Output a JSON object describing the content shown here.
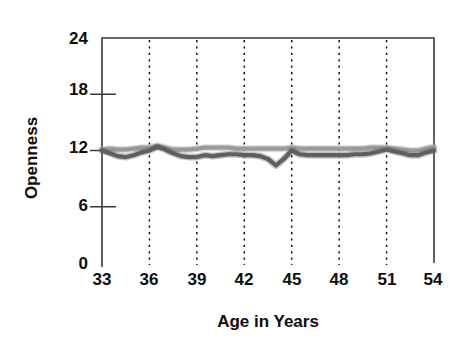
{
  "chart_data": {
    "type": "line",
    "title": "",
    "xlabel": "Age in Years",
    "ylabel": "Openness",
    "xlim": [
      33,
      54
    ],
    "ylim": [
      0,
      24
    ],
    "xticks": [
      33,
      36,
      39,
      42,
      45,
      48,
      51,
      54
    ],
    "yticks": [
      0,
      6,
      12,
      18,
      24
    ],
    "grid": "vertical-dotted-at-xticks",
    "legend": "none",
    "colors": {
      "series_light": "#9a9a9a",
      "series_dark": "#5f5f5f",
      "axis": "#3a3a3a",
      "text": "#0d0d0d"
    },
    "x": [
      33.0,
      33.5,
      34.0,
      34.5,
      35.0,
      35.5,
      36.0,
      36.5,
      37.0,
      37.5,
      38.0,
      38.5,
      39.0,
      39.5,
      40.0,
      40.5,
      41.0,
      41.5,
      42.0,
      42.5,
      43.0,
      43.5,
      44.0,
      44.5,
      45.0,
      45.5,
      46.0,
      46.5,
      47.0,
      47.5,
      48.0,
      48.5,
      49.0,
      49.5,
      50.0,
      50.5,
      51.0,
      51.5,
      52.0,
      52.5,
      53.0,
      53.5,
      54.0
    ],
    "series": [
      {
        "name": "Upper series",
        "color": "#9a9a9a",
        "values": [
          12.1,
          12.2,
          12.1,
          12.1,
          12.2,
          12.3,
          12.3,
          12.5,
          12.3,
          12.1,
          12.1,
          12.1,
          12.2,
          12.3,
          12.3,
          12.3,
          12.3,
          12.2,
          12.2,
          12.2,
          12.2,
          12.2,
          12.2,
          12.2,
          12.3,
          12.2,
          12.2,
          12.2,
          12.2,
          12.2,
          12.2,
          12.2,
          12.2,
          12.2,
          12.3,
          12.3,
          12.3,
          12.2,
          12.1,
          12.0,
          12.0,
          12.2,
          12.4
        ]
      },
      {
        "name": "Lower series",
        "color": "#5f5f5f",
        "values": [
          12.0,
          11.7,
          11.4,
          11.3,
          11.5,
          11.8,
          12.0,
          12.4,
          12.1,
          11.7,
          11.4,
          11.3,
          11.3,
          11.5,
          11.4,
          11.5,
          11.6,
          11.6,
          11.5,
          11.5,
          11.4,
          11.1,
          10.4,
          11.1,
          12.0,
          11.6,
          11.5,
          11.5,
          11.5,
          11.5,
          11.5,
          11.5,
          11.6,
          11.6,
          11.7,
          11.9,
          12.1,
          11.9,
          11.7,
          11.5,
          11.5,
          11.8,
          12.0
        ]
      }
    ]
  }
}
